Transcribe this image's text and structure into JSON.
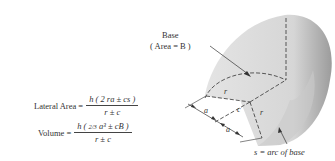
{
  "figure": {
    "base_label_line1": "Base",
    "base_label_line2": "( Area = B )",
    "arc_label": "s = arc of base",
    "dimension_labels": {
      "r1": "r",
      "r2": "r",
      "c": "c",
      "a1": "a",
      "a2": "a"
    }
  },
  "formulas": {
    "lateral_area": {
      "lhs": "Lateral Area =",
      "numerator": "h ( 2 ra ± cs )",
      "denominator": "r ± c"
    },
    "volume": {
      "lhs": "Volume =",
      "numerator_prefix": "h (",
      "numerator_fraction": "2/3",
      "numerator_rest": "a³ ± cB )",
      "denominator": "r ± c"
    }
  },
  "colors": {
    "solid_fill": "#e6e6e6",
    "solid_shadow": "#b8b8b8",
    "line": "#333333"
  }
}
